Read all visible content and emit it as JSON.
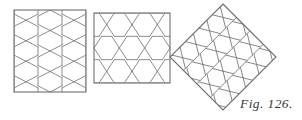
{
  "figure": {
    "caption": "Fig. 126.",
    "background_color": "#ffffff",
    "line_color": "#808080",
    "frame_color": "#6e6e6e",
    "caption_color": "#3a3a3a"
  },
  "panels": [
    {
      "id": "panel-left",
      "description": "Rectangle filled with vertically elongated hexagons",
      "frame": {
        "x": 14,
        "y": 10,
        "width": 72,
        "height": 82
      },
      "tiling": {
        "orientation": "vertical",
        "columns": 3,
        "rows": 4,
        "cell_width": 24,
        "cell_height": 20.5
      }
    },
    {
      "id": "panel-middle",
      "description": "Rectangle filled with horizontally elongated hexagons",
      "frame": {
        "x": 94,
        "y": 13,
        "width": 76,
        "height": 70
      },
      "tiling": {
        "orientation": "horizontal",
        "columns": 3,
        "rows": 3,
        "cell_width": 25.33,
        "cell_height": 23.33
      }
    },
    {
      "id": "panel-right",
      "description": "Square rotated 45 degrees (diamond) filled with hexagons",
      "frame": {
        "center_x": 223,
        "center_y": 57,
        "half_diagonal": 53,
        "rotation_degrees": 45
      },
      "tiling": {
        "orientation": "vertical",
        "columns": 4,
        "rows": 4,
        "cell_width": 19,
        "cell_height": 19
      }
    }
  ],
  "caption_position": {
    "x": 240,
    "y": 108
  }
}
